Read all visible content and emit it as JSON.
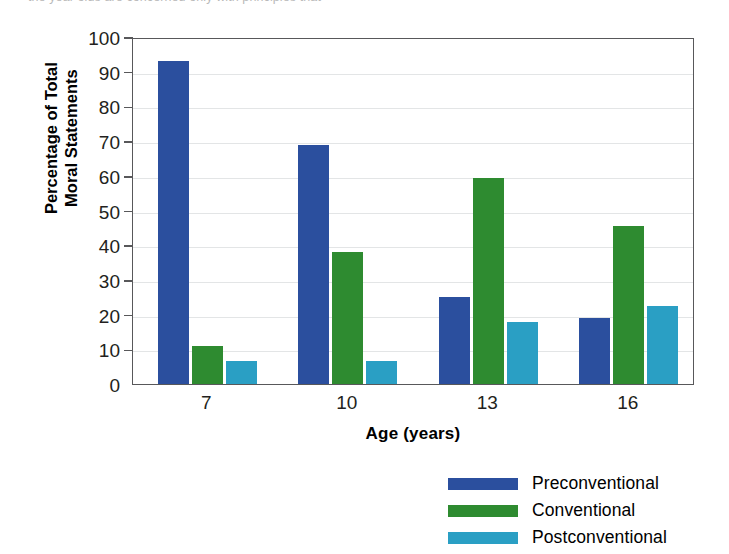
{
  "page": {
    "clipped_caption_fragment": "the year olds are concerned only with principles that"
  },
  "chart_data": {
    "type": "bar",
    "title": "",
    "xlabel": "Age (years)",
    "ylabel": "Percentage of Total\nMoral Statements",
    "ylabel_line1": "Percentage of Total",
    "ylabel_line2": "Moral Statements",
    "categories": [
      "7",
      "10",
      "13",
      "16"
    ],
    "series": [
      {
        "name": "Preconventional",
        "color": "#2B4F9E",
        "values": [
          93,
          69,
          25,
          19
        ]
      },
      {
        "name": "Conventional",
        "color": "#2E8B30",
        "values": [
          11,
          38,
          59.5,
          45.5
        ]
      },
      {
        "name": "Postconventional",
        "color": "#2A9FC4",
        "values": [
          6.5,
          6.5,
          18,
          22.5
        ]
      }
    ],
    "ylim": [
      0,
      100
    ],
    "yticks": [
      0,
      10,
      20,
      30,
      40,
      50,
      60,
      70,
      80,
      90,
      100
    ],
    "ytick_labels": [
      "0",
      "10",
      "20",
      "30",
      "40",
      "50",
      "60",
      "70",
      "80",
      "90",
      "100"
    ],
    "grid": true,
    "grid_axis": "y",
    "legend_position": "bottom-right",
    "legend": [
      "Preconventional",
      "Conventional",
      "Postconventional"
    ]
  }
}
